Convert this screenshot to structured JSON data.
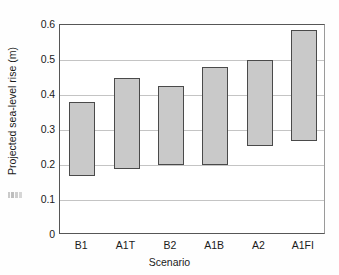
{
  "chart_data": {
    "type": "bar",
    "bar_style": "floating-range",
    "title": "",
    "xlabel": "Scenario",
    "ylabel": "Projected sea-level rise (m)",
    "categories": [
      "B1",
      "A1T",
      "B2",
      "A1B",
      "A2",
      "A1FI"
    ],
    "ylim": [
      0,
      0.6
    ],
    "yticks": [
      0,
      0.1,
      0.2,
      0.3,
      0.4,
      0.5,
      0.6
    ],
    "ytick_labels": [
      "0",
      "0.1",
      "0.2",
      "0.3",
      "0.4",
      "0.5",
      "0.6"
    ],
    "grid": "horizontal",
    "legend": "none",
    "series": [
      {
        "name": "Range low",
        "values": [
          0.17,
          0.19,
          0.2,
          0.2,
          0.255,
          0.27
        ]
      },
      {
        "name": "Range high",
        "values": [
          0.38,
          0.45,
          0.425,
          0.48,
          0.5,
          0.585
        ]
      }
    ],
    "ranges": [
      {
        "category": "B1",
        "low": 0.17,
        "high": 0.38
      },
      {
        "category": "A1T",
        "low": 0.19,
        "high": 0.45
      },
      {
        "category": "B2",
        "low": 0.2,
        "high": 0.425
      },
      {
        "category": "A1B",
        "low": 0.2,
        "high": 0.48
      },
      {
        "category": "A2",
        "low": 0.255,
        "high": 0.5
      },
      {
        "category": "A1FI",
        "low": 0.27,
        "high": 0.585
      }
    ],
    "colors": {
      "bar_fill": "#c9c9c9",
      "bar_border": "#4a4a4a",
      "gridline": "#c4c4c4",
      "axis": "#565656",
      "text": "#1a1a1a",
      "background": "#ffffff"
    }
  }
}
